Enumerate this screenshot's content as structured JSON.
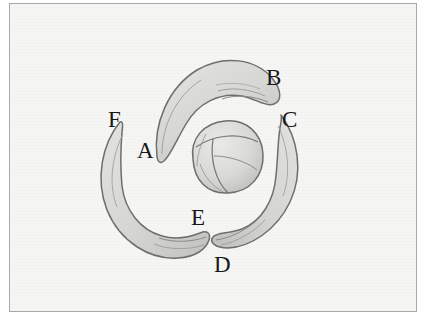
{
  "figure": {
    "background_color": "#f6f6f5",
    "border_color": "#a9a9a9",
    "outline_color": "#6e6e6e",
    "fill_color": "#dcdcda",
    "shade_color": "#c6c6c3",
    "label_color": "#171717"
  },
  "labels": [
    {
      "id": "A",
      "text": "A",
      "x": 134,
      "y": 138
    },
    {
      "id": "B",
      "text": "B",
      "x": 263,
      "y": 65
    },
    {
      "id": "C",
      "text": "C",
      "x": 279,
      "y": 107
    },
    {
      "id": "D",
      "text": "D",
      "x": 211,
      "y": 252
    },
    {
      "id": "E",
      "text": "E",
      "x": 188,
      "y": 205
    },
    {
      "id": "F",
      "text": "F",
      "x": 105,
      "y": 107
    }
  ],
  "shapes": [
    {
      "id": "claw-top",
      "name": "top-claw-shape",
      "tips": [
        "A",
        "B"
      ],
      "description": "Thick curved claw arcing from lower-left tip A up and over to pointed tip B at upper right"
    },
    {
      "id": "claw-right",
      "name": "right-claw-shape",
      "tips": [
        "C",
        "D"
      ],
      "description": "Curved claw from pointed tip C at top sweeping right and down to tip D at lower left"
    },
    {
      "id": "claw-left",
      "name": "left-claw-shape",
      "tips": [
        "F",
        "E"
      ],
      "description": "Curved claw from pointed tip F at upper left sweeping down and around to tip E at lower right"
    },
    {
      "id": "center-bud",
      "name": "center-bud-shape",
      "tips": [],
      "description": "Rounded bud at center with internal segment division lines"
    }
  ]
}
